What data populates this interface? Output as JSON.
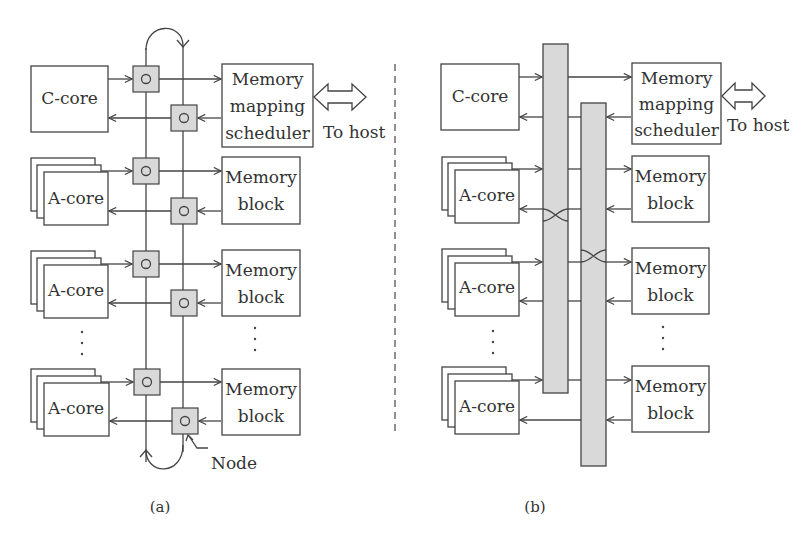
{
  "panels": {
    "a": {
      "caption": "(a)",
      "c_core": "C-core",
      "mms": [
        "Memory",
        "mapping",
        "scheduler"
      ],
      "to_host": "To host",
      "rows": [
        {
          "a_core": "A-core",
          "memory": [
            "Memory",
            "block"
          ]
        },
        {
          "a_core": "A-core",
          "memory": [
            "Memory",
            "block"
          ]
        },
        {
          "a_core": "A-core",
          "memory": [
            "Memory",
            "block"
          ]
        }
      ],
      "node_label": "Node"
    },
    "b": {
      "caption": "(b)",
      "c_core": "C-core",
      "mms": [
        "Memory",
        "mapping",
        "scheduler"
      ],
      "to_host": "To host",
      "rows": [
        {
          "a_core": "A-core",
          "memory": [
            "Memory",
            "block"
          ]
        },
        {
          "a_core": "A-core",
          "memory": [
            "Memory",
            "block"
          ]
        },
        {
          "a_core": "A-core",
          "memory": [
            "Memory",
            "block"
          ]
        }
      ]
    }
  },
  "ellipsis": "⋮",
  "colors": {
    "stroke": "#444444",
    "fill_shaded": "#d9d9d9"
  }
}
